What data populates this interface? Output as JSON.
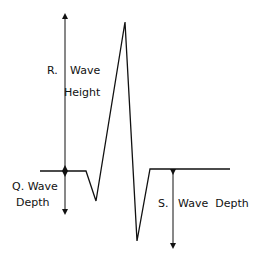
{
  "diagram": {
    "labels": {
      "r_prefix": "R.",
      "r_wave": "Wave",
      "r_height": "Height",
      "q_line1": "Q. Wave",
      "q_line2": "Depth",
      "s_prefix": "S.",
      "s_label": "Wave  Depth"
    },
    "colors": {
      "stroke": "#111111",
      "background": "#ffffff"
    }
  }
}
